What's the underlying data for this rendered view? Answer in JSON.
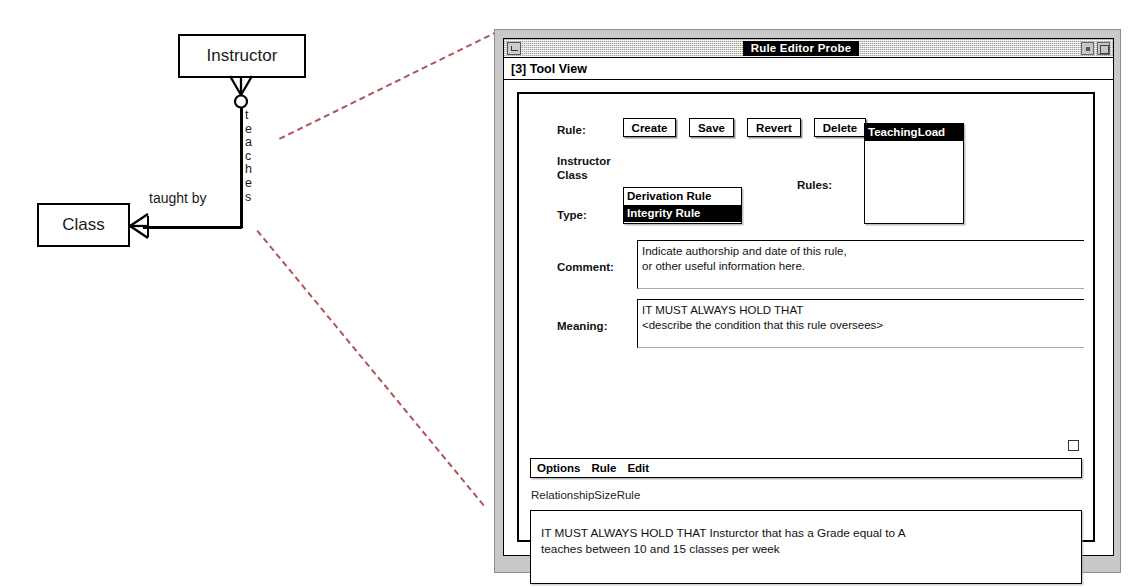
{
  "diagram": {
    "entities": [
      {
        "name": "Instructor"
      },
      {
        "name": "Class"
      }
    ],
    "relationship_vertical_label": "teaches",
    "relationship_horizontal_label": "taught by"
  },
  "window": {
    "title": "Rule Editor Probe",
    "tool_view_label": "[3] Tool View",
    "titlebar_buttons": {
      "minimize": "minimize-icon",
      "restore": "restore-icon",
      "maximize": "maximize-icon"
    }
  },
  "form": {
    "rule_label": "Rule:",
    "buttons": [
      {
        "label": "Create"
      },
      {
        "label": "Save"
      },
      {
        "label": "Revert"
      },
      {
        "label": "Delete"
      }
    ],
    "context_lines": [
      "Instructor",
      "Class"
    ],
    "type_label": "Type:",
    "type_options": [
      {
        "label": "Derivation Rule",
        "selected": false
      },
      {
        "label": "Integrity Rule",
        "selected": true
      }
    ],
    "rules_label": "Rules:",
    "rules_list": [
      {
        "label": "TeachingLoad",
        "selected": true
      }
    ],
    "comment_label": "Comment:",
    "comment_value": "Indicate authorship and date of this rule,\nor other useful information here.",
    "meaning_label": "Meaning:",
    "meaning_value": "IT MUST ALWAYS HOLD THAT\n<describe the condition that this rule oversees>"
  },
  "bottom": {
    "menu_items": [
      {
        "label": "Options"
      },
      {
        "label": "Rule"
      },
      {
        "label": "Edit"
      }
    ],
    "rule_name": "RelationshipSizeRule",
    "rule_text": "IT MUST ALWAYS HOLD THAT Insturctor that has a Grade equal to A\nteaches between 10 and 15 classes per week"
  },
  "colors": {
    "callout_dash": "#b0545a",
    "window_chrome": "#c9c9c9",
    "selection": "#000000"
  }
}
